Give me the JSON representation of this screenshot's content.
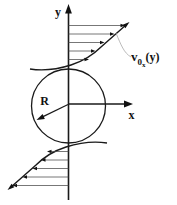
{
  "diagram": {
    "labels": {
      "y_axis": "y",
      "x_axis": "x",
      "radius": "R",
      "velocity_main": "v",
      "velocity_sub0": "0",
      "velocity_subx": "x",
      "velocity_args": "(y)"
    },
    "colors": {
      "stroke": "#1a1a1a",
      "thin_line": "#4a4a4a",
      "arrowhead": "#111111",
      "leader_line": "#aaaaaa",
      "background": "#ffffff"
    },
    "profile": {
      "axis_x": 68.5,
      "top_arrows": [
        {
          "y": 25.5,
          "x_head": 125
        },
        {
          "y": 34,
          "x_head": 114.5
        },
        {
          "y": 42.5,
          "x_head": 104.5
        },
        {
          "y": 51,
          "x_head": 95.5
        },
        {
          "y": 59.5,
          "x_head": 89
        }
      ],
      "bottom_arrows": [
        {
          "y": 151.5,
          "x_head": 47
        },
        {
          "y": 160,
          "x_head": 41
        },
        {
          "y": 168.5,
          "x_head": 32.5
        },
        {
          "y": 177,
          "x_head": 22.5
        },
        {
          "y": 185.5,
          "x_head": 12.5
        }
      ]
    }
  }
}
